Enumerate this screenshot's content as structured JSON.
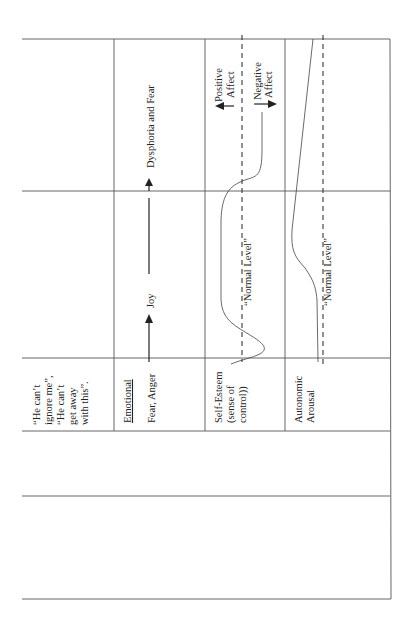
{
  "figure": {
    "rows_rotated": [
      {
        "id": "thought",
        "label_lines": [
          "“He can’t",
          "ignore me”,",
          "“He can’t",
          "get away",
          "with this”."
        ]
      },
      {
        "id": "emotional",
        "heading": "Emotional",
        "start_label": "Fear, Anger",
        "mid_label": "Joy",
        "end_label": "Dysphoria and Fear"
      },
      {
        "id": "self_esteem",
        "label_lines": [
          "Self-Esteem",
          "(sense of",
          "control))"
        ],
        "normal_label": "“Normal Level”",
        "positive_label_lines": [
          "Positive",
          "Affect"
        ],
        "negative_label_lines": [
          "Negative",
          "Affect"
        ]
      },
      {
        "id": "autonomic",
        "label_lines": [
          "Autonomic",
          "Arousal"
        ],
        "normal_label": "“Normal Level”"
      }
    ],
    "colors": {
      "line": "#555555",
      "text": "#222222",
      "background": "#ffffff"
    }
  }
}
